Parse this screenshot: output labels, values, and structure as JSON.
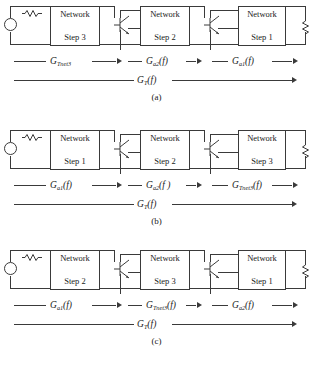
{
  "figure": {
    "panels": [
      {
        "id": "a",
        "caption": "(a)",
        "boxes": [
          {
            "line1": "Network",
            "line2": "Step 3"
          },
          {
            "line1": "Network",
            "line2": "Step 2"
          },
          {
            "line1": "Network",
            "line2": "Step 1"
          }
        ],
        "stage_labels": [
          {
            "base": "G",
            "sub": "Tnet3",
            "arg": ""
          },
          {
            "base": "G",
            "sub": "a2",
            "arg": "(f)"
          },
          {
            "base": "G",
            "sub": "a1",
            "arg": "(f)"
          }
        ],
        "total_label": {
          "base": "G",
          "sub": "T",
          "arg": "(f)"
        }
      },
      {
        "id": "b",
        "caption": "(b)",
        "boxes": [
          {
            "line1": "Network",
            "line2": "Step 1"
          },
          {
            "line1": "Network",
            "line2": "Step 2"
          },
          {
            "line1": "Network",
            "line2": "Step 3"
          }
        ],
        "stage_labels": [
          {
            "base": "G",
            "sub": "a1",
            "arg": "(f)"
          },
          {
            "base": "G",
            "sub": "a2",
            "arg": "(f )"
          },
          {
            "base": "G",
            "sub": "Tnet3",
            "arg": "(f)"
          }
        ],
        "total_label": {
          "base": "G",
          "sub": "T",
          "arg": "(f)"
        }
      },
      {
        "id": "c",
        "caption": "(c)",
        "boxes": [
          {
            "line1": "Network",
            "line2": "Step 2"
          },
          {
            "line1": "Network",
            "line2": "Step 3"
          },
          {
            "line1": "Network",
            "line2": "Step 1"
          }
        ],
        "stage_labels": [
          {
            "base": "G",
            "sub": "a1",
            "arg": "(f)"
          },
          {
            "base": "G",
            "sub": "Tnet3",
            "arg": "(f)"
          },
          {
            "base": "G",
            "sub": "a2",
            "arg": "(f)"
          }
        ],
        "total_label": {
          "base": "G",
          "sub": "T",
          "arg": "(f)"
        }
      }
    ],
    "colors": {
      "line": "#3a3a3a",
      "text": "#1a1a1a",
      "background": "#ffffff"
    }
  }
}
